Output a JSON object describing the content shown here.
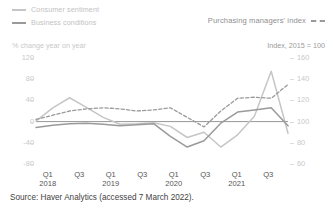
{
  "legend": {
    "left_items": [
      {
        "label": "Consumer sentiment",
        "style": "solid",
        "color": "#c6c6c6",
        "name": "consumer-sentiment"
      },
      {
        "label": "Business conditions",
        "style": "solid",
        "color": "#9a9a9a",
        "name": "business-conditions"
      }
    ],
    "right_item": {
      "label": "Purchasing managers' index",
      "style": "dashed",
      "color": "#9a9a9a",
      "name": "pmi"
    }
  },
  "axes": {
    "left_title": "% change year on year",
    "right_title": "Index, 2015 = 100",
    "left_ticks": [
      "120",
      "80",
      "40",
      "0",
      "-40",
      "-80"
    ],
    "right_ticks": [
      "160",
      "140",
      "120",
      "100",
      "80",
      "60"
    ],
    "x_ticks": [
      {
        "q": "Q1",
        "yr": "2018"
      },
      {
        "q": "Q3",
        "yr": ""
      },
      {
        "q": "Q1",
        "yr": "2019"
      },
      {
        "q": "Q3",
        "yr": ""
      },
      {
        "q": "Q1",
        "yr": "2020"
      },
      {
        "q": "Q3",
        "yr": ""
      },
      {
        "q": "Q1",
        "yr": "2021"
      },
      {
        "q": "Q3",
        "yr": ""
      }
    ]
  },
  "source": "Source: Haver Analytics (accessed 7 March 2022).",
  "chart_data": {
    "type": "line",
    "title": "",
    "xlabel": "",
    "ylabel": "% change year on year",
    "y2label": "Index, 2015 = 100",
    "ylim": [
      -80,
      120
    ],
    "y2lim": [
      60,
      160
    ],
    "grid": false,
    "legend_position": "top",
    "x": [
      "Q1 2018",
      "Q2 2018",
      "Q3 2018",
      "Q4 2018",
      "Q1 2019",
      "Q2 2019",
      "Q3 2019",
      "Q4 2019",
      "Q1 2020",
      "Q2 2020",
      "Q3 2020",
      "Q4 2020",
      "Q1 2021",
      "Q2 2021",
      "Q3 2021",
      "Q4 2021"
    ],
    "series": [
      {
        "name": "Consumer sentiment",
        "axis": "left",
        "style": "solid",
        "color": "#c6c6c6",
        "values": [
          1,
          26,
          45,
          27,
          8,
          -5,
          -4,
          -2,
          -9,
          -30,
          -20,
          -48,
          -25,
          10,
          95,
          -22
        ]
      },
      {
        "name": "Business conditions",
        "axis": "left",
        "style": "solid",
        "color": "#9a9a9a",
        "values": [
          -11,
          -7,
          -4,
          -3,
          -5,
          -8,
          -6,
          -4,
          -28,
          -48,
          -36,
          -3,
          18,
          22,
          26,
          -8
        ]
      },
      {
        "name": "Purchasing managers' index",
        "axis": "right",
        "style": "dashed",
        "color": "#9a9a9a",
        "values": [
          102,
          106,
          110,
          112,
          113,
          112,
          110,
          111,
          113,
          104,
          95,
          110,
          122,
          123,
          122,
          135
        ]
      }
    ]
  }
}
